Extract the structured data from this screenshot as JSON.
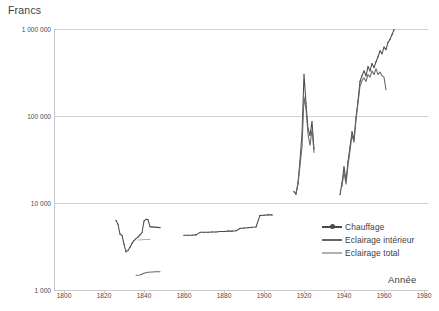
{
  "chart_data": {
    "type": "line",
    "title": "",
    "ylabel": "Francs",
    "xlabel": "Année",
    "y_scale": "log",
    "ylim": [
      1000,
      1000000
    ],
    "xlim": [
      1795,
      1982
    ],
    "grid": true,
    "legend_position": "inside-right",
    "y_ticks": [
      {
        "value": 1000000,
        "label": "1 000 000"
      },
      {
        "value": 100000,
        "label": "100 000"
      },
      {
        "value": 10000,
        "label": "10 000"
      },
      {
        "value": 1000,
        "label": "1 000"
      }
    ],
    "x_ticks": [
      1800,
      1820,
      1840,
      1860,
      1880,
      1900,
      1920,
      1940,
      1960,
      1980
    ],
    "colors": {
      "chauffage": "#4a4a4a",
      "eclairage_interieur": "#666666",
      "eclairage_total": "#b0b0b0",
      "grid": "#d0d0d0",
      "axis": "#c9c9c9",
      "text": "#3d3d3d"
    },
    "series": [
      {
        "name": "Chauffage",
        "color": "#4a4a4a",
        "marker": "dot",
        "segments": [
          [
            [
              1826,
              6300
            ],
            [
              1827,
              5700
            ],
            [
              1828,
              4400
            ],
            [
              1829,
              4250
            ],
            [
              1830,
              3350
            ],
            [
              1831,
              2750
            ],
            [
              1832,
              2850
            ],
            [
              1833,
              3100
            ],
            [
              1834,
              3450
            ],
            [
              1835,
              3700
            ],
            [
              1836,
              3900
            ],
            [
              1837,
              4050
            ],
            [
              1838,
              4300
            ],
            [
              1839,
              4550
            ],
            [
              1840,
              6200
            ],
            [
              1841,
              6500
            ],
            [
              1842,
              6450
            ],
            [
              1843,
              5350
            ],
            [
              1844,
              5300
            ],
            [
              1845,
              5300
            ],
            [
              1846,
              5250
            ],
            [
              1847,
              5250
            ],
            [
              1848,
              5200
            ]
          ],
          [
            [
              1860,
              4250
            ],
            [
              1862,
              4250
            ],
            [
              1864,
              4250
            ],
            [
              1866,
              4300
            ],
            [
              1868,
              4600
            ],
            [
              1870,
              4600
            ],
            [
              1872,
              4600
            ],
            [
              1874,
              4650
            ],
            [
              1876,
              4650
            ],
            [
              1878,
              4700
            ],
            [
              1880,
              4700
            ],
            [
              1882,
              4750
            ],
            [
              1884,
              4750
            ],
            [
              1886,
              4800
            ],
            [
              1888,
              5100
            ],
            [
              1890,
              5150
            ],
            [
              1892,
              5200
            ],
            [
              1894,
              5250
            ],
            [
              1896,
              5300
            ],
            [
              1898,
              7200
            ],
            [
              1900,
              7250
            ],
            [
              1902,
              7300
            ],
            [
              1904,
              7300
            ]
          ],
          [
            [
              1915,
              13500
            ],
            [
              1916,
              12600
            ],
            [
              1917,
              17000
            ],
            [
              1918,
              31000
            ],
            [
              1919,
              62000
            ],
            [
              1920,
              300000
            ],
            [
              1921,
              140000
            ],
            [
              1922,
              72000
            ],
            [
              1923,
              60000
            ],
            [
              1924,
              86000
            ],
            [
              1925,
              42000
            ]
          ],
          [
            [
              1938,
              12500
            ],
            [
              1939,
              17000
            ],
            [
              1940,
              26000
            ],
            [
              1941,
              18000
            ],
            [
              1942,
              30000
            ],
            [
              1943,
              44000
            ],
            [
              1944,
              66000
            ],
            [
              1945,
              54000
            ],
            [
              1946,
              96000
            ],
            [
              1947,
              150000
            ],
            [
              1948,
              250000
            ],
            [
              1949,
              290000
            ],
            [
              1950,
              330000
            ],
            [
              1951,
              290000
            ],
            [
              1952,
              370000
            ],
            [
              1953,
              330000
            ],
            [
              1954,
              400000
            ],
            [
              1955,
              360000
            ],
            [
              1956,
              420000
            ],
            [
              1957,
              480000
            ],
            [
              1958,
              560000
            ],
            [
              1959,
              520000
            ],
            [
              1960,
              620000
            ],
            [
              1961,
              580000
            ],
            [
              1962,
              700000
            ],
            [
              1963,
              760000
            ],
            [
              1964,
              860000
            ],
            [
              1965,
              980000
            ]
          ]
        ]
      },
      {
        "name": "Eclairage intérieur",
        "color": "#666666",
        "marker": "none",
        "segments": [
          [
            [
              1836,
              1480
            ],
            [
              1838,
              1490
            ],
            [
              1840,
              1560
            ],
            [
              1842,
              1600
            ],
            [
              1844,
              1610
            ],
            [
              1846,
              1620
            ],
            [
              1848,
              1620
            ]
          ],
          [
            [
              1916,
              13000
            ],
            [
              1917,
              16500
            ],
            [
              1918,
              27000
            ],
            [
              1919,
              44000
            ],
            [
              1920,
              165000
            ],
            [
              1921,
              120000
            ],
            [
              1922,
              62000
            ],
            [
              1923,
              46000
            ],
            [
              1924,
              70000
            ],
            [
              1925,
              38000
            ]
          ],
          [
            [
              1939,
              15500
            ],
            [
              1940,
              23000
            ],
            [
              1941,
              16500
            ],
            [
              1942,
              27000
            ],
            [
              1943,
              40000
            ],
            [
              1944,
              60000
            ],
            [
              1945,
              50000
            ],
            [
              1946,
              90000
            ],
            [
              1947,
              140000
            ],
            [
              1948,
              220000
            ],
            [
              1949,
              255000
            ],
            [
              1950,
              275000
            ],
            [
              1951,
              250000
            ],
            [
              1952,
              300000
            ],
            [
              1953,
              280000
            ],
            [
              1954,
              330000
            ],
            [
              1955,
              300000
            ],
            [
              1956,
              350000
            ],
            [
              1957,
              300000
            ],
            [
              1958,
              320000
            ],
            [
              1959,
              290000
            ],
            [
              1960,
              280000
            ],
            [
              1961,
              200000
            ]
          ]
        ]
      },
      {
        "name": "Eclairage total",
        "color": "#b0b0b0",
        "marker": "none",
        "segments": [
          [
            [
              1837,
              3750
            ],
            [
              1839,
              3780
            ],
            [
              1841,
              3800
            ],
            [
              1843,
              3800
            ]
          ]
        ]
      }
    ]
  },
  "axes": {
    "y_title": "Francs",
    "x_title": "Année"
  },
  "legend": {
    "items": [
      {
        "label": "Chauffage",
        "color": "#4a4a4a",
        "marker": true
      },
      {
        "label": "Eclairage intérieur",
        "color": "#666666",
        "marker": false
      },
      {
        "label": "Eclairage total",
        "color": "#b0b0b0",
        "marker": false
      }
    ]
  }
}
